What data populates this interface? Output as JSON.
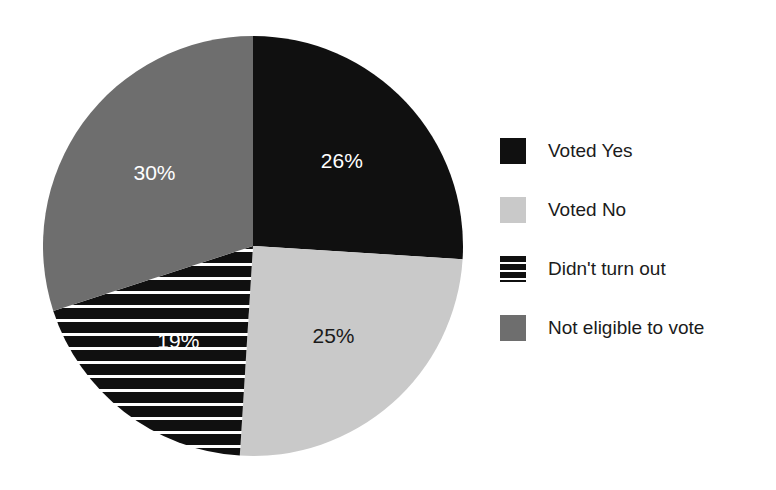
{
  "chart_data": {
    "type": "pie",
    "title": "",
    "subtitle": "",
    "xlabel": "",
    "ylabel": "",
    "grid": false,
    "legend_position": "right",
    "start_angle_deg": 0,
    "direction": "clockwise",
    "categories": [
      "Voted Yes",
      "Voted No",
      "Didn't turn out",
      "Not eligible to vote"
    ],
    "values": [
      26,
      25,
      19,
      30
    ],
    "value_unit": "%",
    "data_labels": [
      "26%",
      "25%",
      "19%",
      "30%"
    ],
    "slices": [
      {
        "label": "Voted Yes",
        "value": 26,
        "data_label": "26%",
        "color": "#101010",
        "pattern": "solid",
        "label_color": "#ffffff"
      },
      {
        "label": "Voted No",
        "value": 25,
        "data_label": "25%",
        "color": "#c9c9c9",
        "pattern": "solid",
        "label_color": "#1a1a1a"
      },
      {
        "label": "Didn't turn out",
        "value": 19,
        "data_label": "19%",
        "color": "#101010",
        "pattern": "horizontal-stripes",
        "label_color": "#ffffff"
      },
      {
        "label": "Not eligible to vote",
        "value": 30,
        "data_label": "30%",
        "color": "#6e6e6e",
        "pattern": "solid",
        "label_color": "#ffffff"
      }
    ]
  },
  "legend": {
    "items": [
      {
        "label": "Voted Yes",
        "swatch_name": "legend-swatch-voted-yes"
      },
      {
        "label": "Voted No",
        "swatch_name": "legend-swatch-voted-no"
      },
      {
        "label": "Didn't turn out",
        "swatch_name": "legend-swatch-didnt-turn-out"
      },
      {
        "label": "Not eligible to vote",
        "swatch_name": "legend-swatch-not-eligible"
      }
    ]
  },
  "colors": {
    "background": "#ffffff",
    "black": "#101010",
    "light_gray": "#c9c9c9",
    "mid_gray": "#6e6e6e",
    "text": "#1b1b1b",
    "label_light": "#ffffff",
    "label_dark": "#1a1a1a"
  }
}
